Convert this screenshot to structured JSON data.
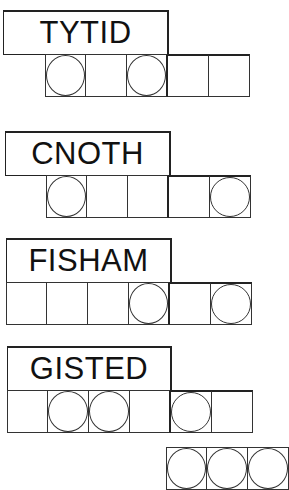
{
  "puzzles": [
    {
      "word": "TYTID",
      "cells": [
        true,
        false,
        true,
        false,
        false
      ]
    },
    {
      "word": "CNOTH",
      "cells": [
        true,
        false,
        false,
        false,
        true
      ]
    },
    {
      "word": "FISHAM",
      "cells": [
        false,
        false,
        false,
        true,
        false,
        true
      ]
    },
    {
      "word": "GISTED",
      "cells": [
        false,
        true,
        true,
        false,
        true,
        false
      ]
    }
  ],
  "answer_row": {
    "cells": [
      true,
      true,
      true
    ]
  },
  "colors": {
    "line": "#222222",
    "background": "#ffffff",
    "text": "#111111"
  }
}
